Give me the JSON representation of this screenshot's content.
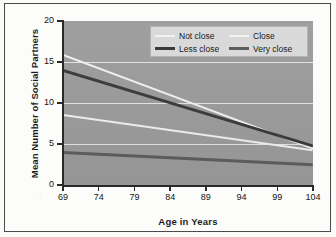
{
  "figure": {
    "background_color": "#fcfcfb",
    "plot_background_color": "#9c9c9c",
    "frame_color": "#4a4a4a"
  },
  "legend": {
    "background_color": "#d9d9d9",
    "border_color": "#b4b4b4",
    "entries": [
      {
        "label": "Not close",
        "color": "#f2f2f2",
        "weight": "thin"
      },
      {
        "label": "Close",
        "color": "#f2f2f2",
        "weight": "thin"
      },
      {
        "label": "Less close",
        "color": "#3a3a3a",
        "weight": "thick"
      },
      {
        "label": "Very close",
        "color": "#5e5e5e",
        "weight": "thick"
      }
    ]
  },
  "chart_data": {
    "type": "line",
    "title": "",
    "xlabel": "Age in Years",
    "ylabel": "Mean Number of Social Partners",
    "x": [
      69,
      104
    ],
    "xlim": [
      69,
      104
    ],
    "ylim": [
      0,
      20
    ],
    "xticks": [
      69,
      74,
      79,
      84,
      89,
      94,
      99,
      104
    ],
    "yticks": [
      0,
      5,
      10,
      15,
      20
    ],
    "gridlines_y": [
      5,
      10,
      15
    ],
    "grid": true,
    "grid_color": "#ebebeb",
    "legend_position": "top-right",
    "series": [
      {
        "name": "Not close",
        "color": "#f2f2f2",
        "weight": "thin",
        "values": [
          16.0,
          4.6
        ]
      },
      {
        "name": "Less close",
        "color": "#3a3a3a",
        "weight": "thick",
        "values": [
          14.1,
          4.9
        ]
      },
      {
        "name": "Close",
        "color": "#f2f2f2",
        "weight": "thin",
        "values": [
          8.7,
          4.4
        ]
      },
      {
        "name": "Very close",
        "color": "#5e5e5e",
        "weight": "thick",
        "values": [
          4.2,
          2.7
        ]
      }
    ]
  }
}
